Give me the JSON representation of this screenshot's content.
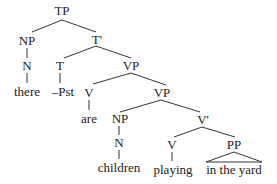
{
  "tree": {
    "nodes": {
      "tp": "TP",
      "np1": "NP",
      "n1": "N",
      "there": "there",
      "tbar": "T'",
      "t": "T",
      "pst": "–Pst",
      "vp1": "VP",
      "v1": "V",
      "are": "are",
      "vp2": "VP",
      "np2": "NP",
      "n2": "N",
      "children": "children",
      "vbar": "V'",
      "v2": "V",
      "playing": "playing",
      "pp": "PP",
      "yard": "in the yard"
    }
  }
}
